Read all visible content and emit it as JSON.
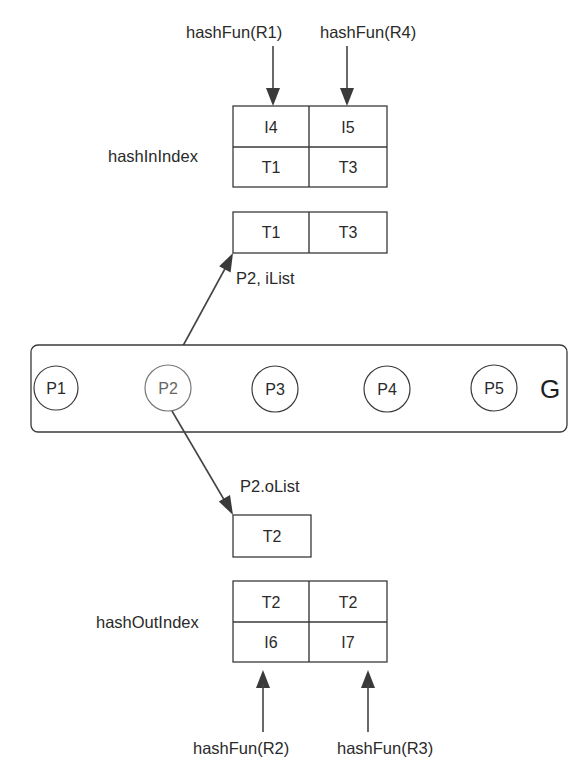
{
  "diagram": {
    "graph_label": "G",
    "nodes": [
      {
        "id": "P1",
        "label": "P1"
      },
      {
        "id": "P2",
        "label": "P2",
        "highlighted": true
      },
      {
        "id": "P3",
        "label": "P3"
      },
      {
        "id": "P4",
        "label": "P4"
      },
      {
        "id": "P5",
        "label": "P5"
      }
    ],
    "hash_in_index": {
      "label": "hashInIndex",
      "inputs": [
        "hashFun(R1)",
        "hashFun(R4)"
      ],
      "rows": [
        [
          "I4",
          "I5"
        ],
        [
          "T1",
          "T3"
        ]
      ]
    },
    "in_list": {
      "label": "P2, iList",
      "cells": [
        "T1",
        "T3"
      ]
    },
    "out_list": {
      "label": "P2.oList",
      "cells": [
        "T2"
      ]
    },
    "hash_out_index": {
      "label": "hashOutIndex",
      "inputs": [
        "hashFun(R2)",
        "hashFun(R3)"
      ],
      "rows": [
        [
          "T2",
          "T2"
        ],
        [
          "I6",
          "I7"
        ]
      ]
    },
    "colors": {
      "stroke": "#3a3a3a",
      "text": "#2a2a2a",
      "highlight_node": "#777777",
      "background": "#ffffff"
    }
  }
}
